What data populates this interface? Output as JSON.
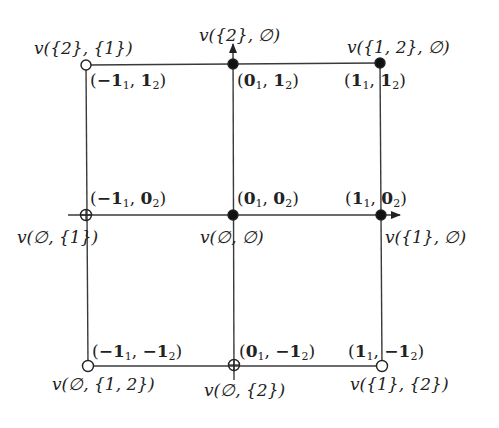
{
  "diagram": {
    "title": "",
    "grid": {
      "columns_x": [
        86,
        233,
        381
      ],
      "rows_y": [
        64,
        215,
        365
      ],
      "line_color": "#333333"
    },
    "axes": {
      "horizontal": {
        "from": [
          68,
          215
        ],
        "to": [
          400,
          215
        ],
        "arrow": true
      },
      "vertical": {
        "from": [
          233,
          380
        ],
        "to": [
          233,
          44
        ],
        "arrow": true
      }
    },
    "nodes": [
      {
        "id": "n-m1-p1",
        "x": 86,
        "y": 65,
        "marker": "open",
        "vertex_label": "v({2}, {1})",
        "coord_label": "(−1₁, 1₂)",
        "v_text": [
          "v(",
          "{2}",
          ", ",
          "{1}",
          ")"
        ],
        "c_parts": {
          "a": "−1",
          "as": "1",
          "b": "1",
          "bs": "2"
        }
      },
      {
        "id": "n-0-p1",
        "x": 233,
        "y": 64,
        "marker": "filled",
        "vertex_label": "v({2}, ∅)",
        "coord_label": "(0₁, 1₂)",
        "c_parts": {
          "a": "0",
          "as": "1",
          "b": "1",
          "bs": "2"
        }
      },
      {
        "id": "n-p1-p1",
        "x": 380,
        "y": 63,
        "marker": "filled",
        "vertex_label": "v({1, 2}, ∅)",
        "coord_label": "(1₁, 1₂)",
        "c_parts": {
          "a": "1",
          "as": "1",
          "b": "1",
          "bs": "2"
        }
      },
      {
        "id": "n-m1-0",
        "x": 86,
        "y": 215,
        "marker": "crossed",
        "vertex_label": "v(∅, {1})",
        "coord_label": "(−1₁, 0₂)",
        "c_parts": {
          "a": "−1",
          "as": "1",
          "b": "0",
          "bs": "2"
        }
      },
      {
        "id": "n-0-0",
        "x": 233,
        "y": 215,
        "marker": "filled",
        "vertex_label": "v(∅, ∅)",
        "coord_label": "(0₁, 0₂)",
        "c_parts": {
          "a": "0",
          "as": "1",
          "b": "0",
          "bs": "2"
        }
      },
      {
        "id": "n-p1-0",
        "x": 381,
        "y": 215,
        "marker": "filled",
        "vertex_label": "v({1}, ∅)",
        "coord_label": "(1₁, 0₂)",
        "c_parts": {
          "a": "1",
          "as": "1",
          "b": "0",
          "bs": "2"
        }
      },
      {
        "id": "n-m1-m1",
        "x": 88,
        "y": 366,
        "marker": "open",
        "vertex_label": "v(∅, {1, 2})",
        "coord_label": "(−1₁, −1₂)",
        "c_parts": {
          "a": "−1",
          "as": "1",
          "b": "−1",
          "bs": "2"
        }
      },
      {
        "id": "n-0-m1",
        "x": 234,
        "y": 365,
        "marker": "crossed",
        "vertex_label": "v(∅, {2})",
        "coord_label": "(0₁, −1₂)",
        "c_parts": {
          "a": "0",
          "as": "1",
          "b": "−1",
          "bs": "2"
        }
      },
      {
        "id": "n-p1-m1",
        "x": 382,
        "y": 366,
        "marker": "open",
        "vertex_label": "v({1}, {2})",
        "coord_label": "(1₁, −1₂)",
        "c_parts": {
          "a": "1",
          "as": "1",
          "b": "−1",
          "bs": "2"
        }
      }
    ],
    "labels": {
      "v_top_left": "v({2}, {1})",
      "v_top_mid": "v({2}, ∅)",
      "v_top_right": "v({1, 2}, ∅)",
      "v_mid_left": "v(∅, {1})",
      "v_mid_mid": "v(∅, ∅)",
      "v_mid_right": "v({1}, ∅)",
      "v_bot_left": "v(∅, {1, 2})",
      "v_bot_mid": "v(∅, {2})",
      "v_bot_right": "v({1}, {2})"
    },
    "coords": {
      "top_left": {
        "a": "−1",
        "as": "1",
        "b": "1",
        "bs": "2"
      },
      "top_mid": {
        "a": "0",
        "as": "1",
        "b": "1",
        "bs": "2"
      },
      "top_right": {
        "a": "1",
        "as": "1",
        "b": "1",
        "bs": "2"
      },
      "mid_left": {
        "a": "−1",
        "as": "1",
        "b": "0",
        "bs": "2"
      },
      "mid_mid": {
        "a": "0",
        "as": "1",
        "b": "0",
        "bs": "2"
      },
      "mid_right": {
        "a": "1",
        "as": "1",
        "b": "0",
        "bs": "2"
      },
      "bot_left": {
        "a": "−1",
        "as": "1",
        "b": "−1",
        "bs": "2"
      },
      "bot_mid": {
        "a": "0",
        "as": "1",
        "b": "−1",
        "bs": "2"
      },
      "bot_right": {
        "a": "1",
        "as": "1",
        "b": "−1",
        "bs": "2"
      }
    },
    "punct": {
      "open": "(",
      "close": ")",
      "comma": ", "
    }
  }
}
